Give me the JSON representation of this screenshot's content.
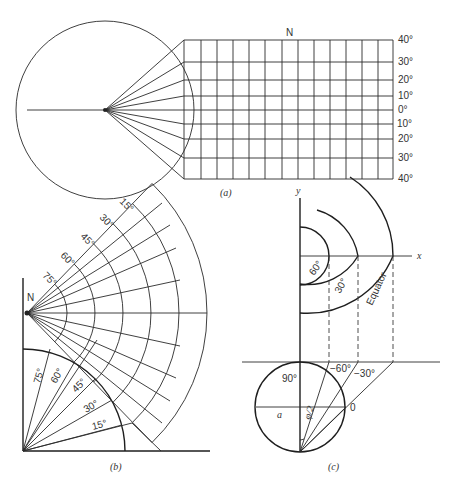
{
  "panel_a": {
    "caption": "(a)",
    "north_label": "N",
    "latitude_labels": [
      "40°",
      "30°",
      "20°",
      "10°",
      "0°",
      "10°",
      "20°",
      "30°",
      "40°"
    ]
  },
  "panel_b": {
    "caption": "(b)",
    "north_label": "N",
    "fan_arc_labels": [
      "15°",
      "30°",
      "45°",
      "60°",
      "75°"
    ],
    "quadrant_ray_labels": [
      "75°",
      "60°",
      "45°",
      "30°",
      "15°"
    ]
  },
  "panel_c": {
    "caption": "(c)",
    "x_axis_label": "x",
    "y_axis_label": "y",
    "arc_labels": [
      "60°",
      "30°",
      "Equator"
    ],
    "circle_labels": {
      "top": "90°",
      "minus60": "−60°",
      "minus30": "−30°",
      "zero": "0",
      "radius": "a",
      "angle": "φ/2"
    }
  }
}
